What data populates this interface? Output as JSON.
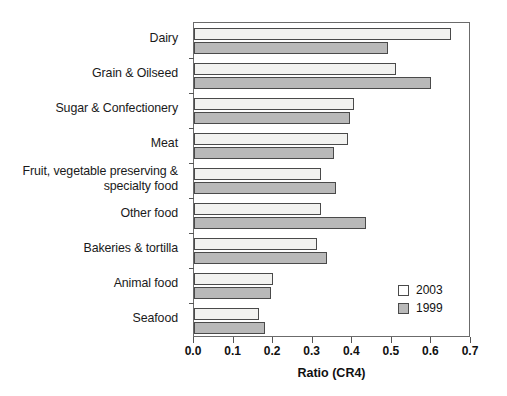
{
  "chart_data": {
    "type": "bar",
    "orientation": "horizontal",
    "title": "",
    "subtitle": "",
    "xlabel": "Ratio (CR4)",
    "ylabel": "",
    "xlim": [
      0.0,
      0.7
    ],
    "xticks": [
      "0.0",
      "0.1",
      "0.2",
      "0.3",
      "0.4",
      "0.5",
      "0.6",
      "0.7"
    ],
    "xtick_values": [
      0.0,
      0.1,
      0.2,
      0.3,
      0.4,
      0.5,
      0.6,
      0.7
    ],
    "grid": false,
    "legend_position": "inside-bottom-right",
    "categories": [
      "Dairy",
      "Grain & Oilseed",
      "Sugar & Confectionery",
      "Meat",
      "Fruit, vegetable preserving &\nspecialty food",
      "Other food",
      "Bakeries & tortilla",
      "Animal food",
      "Seafood"
    ],
    "series": [
      {
        "name": "2003",
        "color": "#f2f2f0",
        "values": [
          0.65,
          0.51,
          0.405,
          0.39,
          0.32,
          0.32,
          0.31,
          0.2,
          0.165
        ]
      },
      {
        "name": "1999",
        "color": "#b9b9b9",
        "values": [
          0.49,
          0.6,
          0.395,
          0.355,
          0.36,
          0.435,
          0.335,
          0.195,
          0.18
        ]
      }
    ]
  },
  "legend": {
    "entries": [
      {
        "label": "2003",
        "swatch": "white-square"
      },
      {
        "label": "1999",
        "swatch": "gray-square"
      }
    ]
  }
}
